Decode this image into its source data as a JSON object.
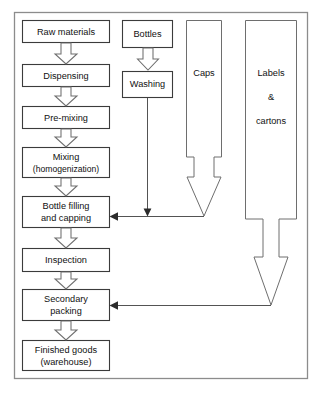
{
  "diagram": {
    "frame": {
      "label": "diagram-border"
    },
    "colors": {
      "box_stroke": "#3b3b3b",
      "frame_stroke": "#8c8c8c",
      "arrow_stroke": "#6e6e6e",
      "line_stroke": "#3f3f3f",
      "background": "#ffffff",
      "text": "#111111"
    },
    "process_chain": [
      {
        "id": "raw-materials",
        "label": "Raw materials"
      },
      {
        "id": "dispensing",
        "label": "Dispensing"
      },
      {
        "id": "pre-mixing",
        "label": "Pre-mixing"
      },
      {
        "id": "mixing",
        "label": "Mixing",
        "label2": "(homogenization)"
      },
      {
        "id": "bottle-filling",
        "label": "Bottle filling",
        "label2": "and capping"
      },
      {
        "id": "inspection",
        "label": "Inspection"
      },
      {
        "id": "secondary-packing",
        "label": "Secondary",
        "label2": "packing"
      },
      {
        "id": "finished-goods",
        "label": "Finished goods",
        "label2": "(warehouse)"
      }
    ],
    "bottle_branch": [
      {
        "id": "bottles",
        "label": "Bottles"
      },
      {
        "id": "washing",
        "label": "Washing"
      }
    ],
    "supply_columns": [
      {
        "id": "caps",
        "label": "Caps",
        "feeds": "bottle-filling"
      },
      {
        "id": "labels-cartons",
        "label": "Labels",
        "label2": "&",
        "label3": "cartons",
        "feeds": "secondary-packing"
      }
    ],
    "connectors": [
      {
        "id": "washing-to-filling",
        "from": "washing",
        "to": "bottle-filling"
      },
      {
        "id": "caps-to-filling",
        "from": "caps",
        "to": "bottle-filling"
      },
      {
        "id": "labels-to-packing",
        "from": "labels-cartons",
        "to": "secondary-packing"
      }
    ],
    "caption": ""
  }
}
